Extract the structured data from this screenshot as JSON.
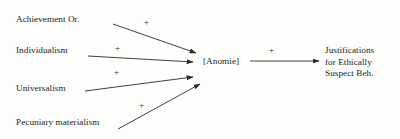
{
  "figure": {
    "type": "path-diagram",
    "background_color": "#fdfdfc",
    "line_color": "#2a2a2a",
    "text_color": "#232323"
  },
  "nodes": {
    "achievement": {
      "label": "Achievement Or.",
      "x": 16,
      "y": 14
    },
    "individualism": {
      "label": "Individualism",
      "x": 16,
      "y": 45
    },
    "universalism": {
      "label": "Universalism",
      "x": 16,
      "y": 83
    },
    "pecuniary": {
      "label": "Pecuniary materialism",
      "x": 16,
      "y": 117
    },
    "anomie": {
      "label": "[Anomie]",
      "x": 203,
      "y": 56
    },
    "justifications": {
      "line1": "Justifications",
      "line2": "for Ethically",
      "line3": "Suspect Beh.",
      "x": 325,
      "y": 45
    }
  },
  "edges": [
    {
      "from": "achievement",
      "to": "anomie",
      "sign": "+",
      "sign_x": 144,
      "sign_y": 18,
      "x1": 113,
      "y1": 24,
      "x2": 196,
      "y2": 53
    },
    {
      "from": "individualism",
      "to": "anomie",
      "sign": "+",
      "sign_x": 115,
      "sign_y": 44,
      "x1": 88,
      "y1": 56,
      "x2": 193,
      "y2": 62
    },
    {
      "from": "universalism",
      "to": "anomie",
      "sign": "+",
      "sign_x": 114,
      "sign_y": 68,
      "x1": 85,
      "y1": 91,
      "x2": 193,
      "y2": 77
    },
    {
      "from": "pecuniary",
      "to": "anomie",
      "sign": "+",
      "sign_x": 139,
      "sign_y": 101,
      "x1": 118,
      "y1": 129,
      "x2": 200,
      "y2": 84
    },
    {
      "from": "anomie",
      "to": "justifications",
      "sign": "+",
      "sign_x": 269,
      "sign_y": 46,
      "x1": 250,
      "y1": 61,
      "x2": 319,
      "y2": 61
    }
  ]
}
